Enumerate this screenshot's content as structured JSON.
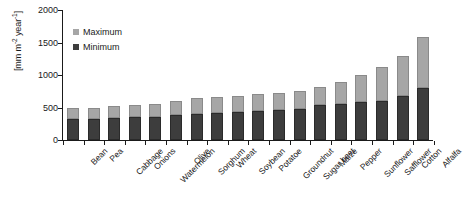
{
  "chart_data": {
    "type": "bar",
    "stacked": true,
    "title": "",
    "xlabel": "",
    "ylabel": "[mm m-2 year-1]",
    "ylabel_parts": {
      "prefix": "[mm m",
      "sup1": "-2",
      "mid": " year",
      "sup2": "-1",
      "suffix": "]"
    },
    "ylim": [
      0,
      2000
    ],
    "yticks": [
      0,
      500,
      1000,
      1500,
      2000
    ],
    "ytick_labels": [
      "0",
      "500",
      "1000",
      "1500",
      "2000"
    ],
    "grid": false,
    "legend_position": "top-left-inside",
    "categories": [
      "Bean",
      "Pea",
      "Cabbage",
      "Onions",
      "Watermelon",
      "Olive",
      "Sorghum",
      "Wheat",
      "Soybean",
      "Potatoe",
      "Groundnut",
      "Sugar beet",
      "Maize",
      "Pepper",
      "Sunflower",
      "Safflower",
      "Cotton",
      "Alfalfa"
    ],
    "series": [
      {
        "name": "Minimum",
        "color": "#3d3d3d",
        "values": [
          320,
          330,
          340,
          350,
          360,
          380,
          400,
          410,
          430,
          450,
          460,
          480,
          540,
          560,
          580,
          600,
          680,
          800
        ]
      },
      {
        "name": "Maximum",
        "color": "#a6a6a6",
        "values": [
          490,
          500,
          520,
          540,
          560,
          600,
          640,
          660,
          680,
          710,
          730,
          760,
          820,
          900,
          1000,
          1120,
          1300,
          1580
        ]
      }
    ],
    "legend": [
      {
        "label": "Maximum",
        "color": "#a6a6a6"
      },
      {
        "label": "Minimum",
        "color": "#3d3d3d"
      }
    ]
  }
}
